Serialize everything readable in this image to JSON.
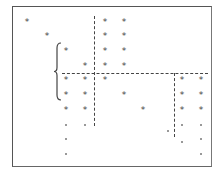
{
  "diagram": {
    "type": "sparse-matrix-pattern",
    "frame": {
      "left": 12,
      "top": 6,
      "right": 212,
      "bottom": 167
    },
    "star_glyph": "*",
    "stars": [
      {
        "x": 27,
        "y": 22
      },
      {
        "x": 105,
        "y": 22
      },
      {
        "x": 124,
        "y": 22
      },
      {
        "x": 47,
        "y": 36
      },
      {
        "x": 105,
        "y": 36
      },
      {
        "x": 124,
        "y": 36
      },
      {
        "x": 66,
        "y": 51
      },
      {
        "x": 105,
        "y": 51
      },
      {
        "x": 124,
        "y": 51
      },
      {
        "x": 85,
        "y": 66
      },
      {
        "x": 105,
        "y": 66
      },
      {
        "x": 124,
        "y": 66
      },
      {
        "x": 66,
        "y": 80
      },
      {
        "x": 85,
        "y": 80
      },
      {
        "x": 105,
        "y": 80
      },
      {
        "x": 182,
        "y": 80
      },
      {
        "x": 201,
        "y": 80
      },
      {
        "x": 66,
        "y": 95
      },
      {
        "x": 85,
        "y": 95
      },
      {
        "x": 124,
        "y": 95
      },
      {
        "x": 182,
        "y": 95
      },
      {
        "x": 201,
        "y": 95
      },
      {
        "x": 66,
        "y": 110
      },
      {
        "x": 85,
        "y": 110
      },
      {
        "x": 143,
        "y": 110
      },
      {
        "x": 182,
        "y": 110
      },
      {
        "x": 201,
        "y": 110
      }
    ],
    "dots": [
      {
        "x": 66,
        "y": 125
      },
      {
        "x": 85,
        "y": 125
      },
      {
        "x": 182,
        "y": 125
      },
      {
        "x": 201,
        "y": 125
      },
      {
        "x": 168,
        "y": 131
      },
      {
        "x": 66,
        "y": 139
      },
      {
        "x": 201,
        "y": 139
      },
      {
        "x": 182,
        "y": 142
      },
      {
        "x": 66,
        "y": 154
      },
      {
        "x": 201,
        "y": 154
      }
    ],
    "dashed_lines": [
      {
        "orientation": "horizontal",
        "x1": 62,
        "x2": 208,
        "y": 73
      },
      {
        "orientation": "vertical",
        "x": 94,
        "y1": 16,
        "y2": 126
      },
      {
        "orientation": "vertical",
        "x": 174,
        "y1": 73,
        "y2": 137
      }
    ],
    "brace": {
      "side": "left",
      "x": 57,
      "y1": 43,
      "y2": 100
    }
  }
}
